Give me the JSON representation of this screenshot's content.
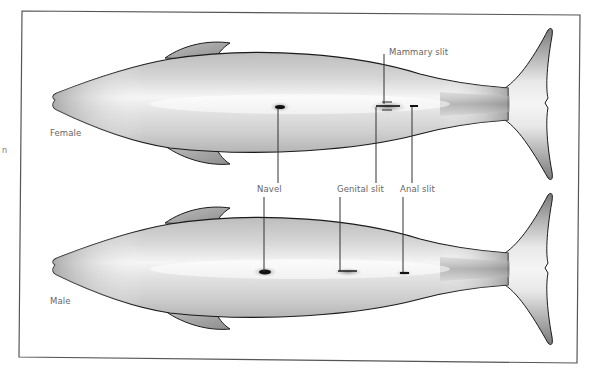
{
  "diagram": {
    "title": "",
    "edge_fragment": "n",
    "specimens": [
      {
        "sex": "Female",
        "label": "Female"
      },
      {
        "sex": "Male",
        "label": "Male"
      }
    ],
    "labels": {
      "mammary_slit": "Mammary slit",
      "navel": "Navel",
      "genital_slit": "Genital slit",
      "anal_slit": "Anal slit"
    },
    "colors": {
      "frame": "#555555",
      "outline": "#1a1a1a",
      "body_light": "#f2f2f2",
      "body_dark": "#8c8c8c",
      "fin": "#9a9a9a",
      "label_text": "#666666",
      "leader_line": "#333333"
    }
  }
}
